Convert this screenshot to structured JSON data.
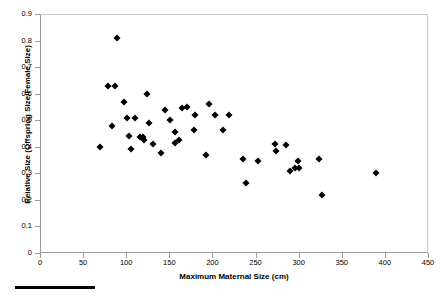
{
  "chart_data": {
    "type": "scatter",
    "title": "",
    "xlabel": "Maximum Maternal Size (cm)",
    "ylabel": "Relative Size (Offspring Size/Female Size)",
    "xlim": [
      0,
      450
    ],
    "ylim": [
      0,
      0.9
    ],
    "xticks": [
      0,
      50,
      100,
      150,
      200,
      250,
      300,
      350,
      400,
      450
    ],
    "yticks": [
      "0",
      "0.1",
      "0.2",
      "0.3",
      "0.4",
      "0.5",
      "0.6",
      "0.7",
      "0.8",
      "0.9"
    ],
    "xtick_labels": [
      "0",
      "50",
      "100",
      "150",
      "200",
      "250",
      "300",
      "350",
      "400",
      "450"
    ],
    "grid": false,
    "legend": false,
    "marker": "diamond",
    "marker_color": "#000000",
    "series": [
      {
        "name": "Species",
        "points": [
          {
            "x": 70,
            "y": 0.4
          },
          {
            "x": 79,
            "y": 0.63
          },
          {
            "x": 87,
            "y": 0.63
          },
          {
            "x": 83,
            "y": 0.48
          },
          {
            "x": 89,
            "y": 0.81
          },
          {
            "x": 97,
            "y": 0.57
          },
          {
            "x": 101,
            "y": 0.51
          },
          {
            "x": 103,
            "y": 0.44
          },
          {
            "x": 105,
            "y": 0.39
          },
          {
            "x": 110,
            "y": 0.51
          },
          {
            "x": 116,
            "y": 0.435
          },
          {
            "x": 120,
            "y": 0.435
          },
          {
            "x": 121,
            "y": 0.425
          },
          {
            "x": 124,
            "y": 0.6
          },
          {
            "x": 126,
            "y": 0.49
          },
          {
            "x": 131,
            "y": 0.41
          },
          {
            "x": 140,
            "y": 0.375
          },
          {
            "x": 145,
            "y": 0.54
          },
          {
            "x": 151,
            "y": 0.5
          },
          {
            "x": 156,
            "y": 0.455
          },
          {
            "x": 157,
            "y": 0.415
          },
          {
            "x": 161,
            "y": 0.425
          },
          {
            "x": 165,
            "y": 0.545
          },
          {
            "x": 171,
            "y": 0.55
          },
          {
            "x": 179,
            "y": 0.465
          },
          {
            "x": 180,
            "y": 0.52
          },
          {
            "x": 192,
            "y": 0.37
          },
          {
            "x": 196,
            "y": 0.56
          },
          {
            "x": 203,
            "y": 0.52
          },
          {
            "x": 212,
            "y": 0.465
          },
          {
            "x": 219,
            "y": 0.52
          },
          {
            "x": 239,
            "y": 0.265
          },
          {
            "x": 236,
            "y": 0.355
          },
          {
            "x": 253,
            "y": 0.345
          },
          {
            "x": 272,
            "y": 0.41
          },
          {
            "x": 274,
            "y": 0.385
          },
          {
            "x": 285,
            "y": 0.405
          },
          {
            "x": 290,
            "y": 0.31
          },
          {
            "x": 296,
            "y": 0.32
          },
          {
            "x": 300,
            "y": 0.32
          },
          {
            "x": 299,
            "y": 0.345
          },
          {
            "x": 324,
            "y": 0.355
          },
          {
            "x": 327,
            "y": 0.22
          },
          {
            "x": 390,
            "y": 0.3
          }
        ]
      }
    ]
  },
  "decoration": {
    "scale_bar_label": ""
  }
}
